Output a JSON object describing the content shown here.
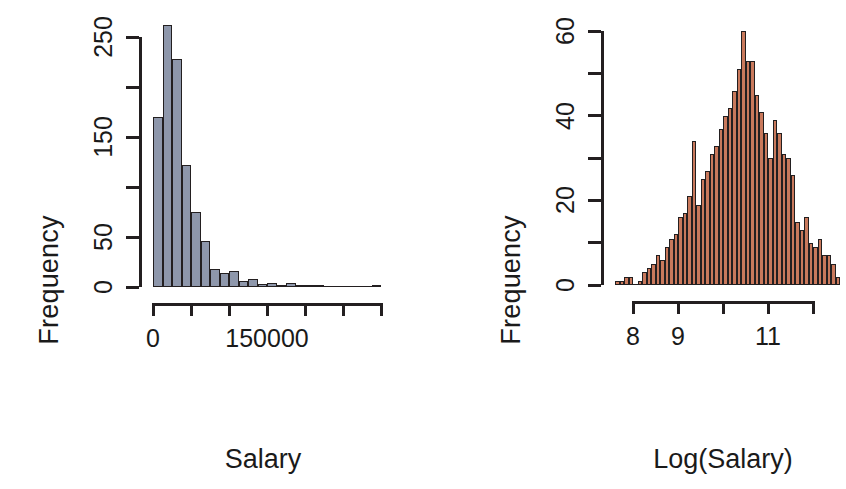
{
  "figure": {
    "background": "#ffffff",
    "axis_color": "#231f20"
  },
  "chart_data": [
    {
      "type": "bar",
      "id": "salary-histogram",
      "title": "",
      "xlabel": "Salary",
      "ylabel": "Frequency",
      "fill_color": "#8e97ab",
      "border_color": "#231f20",
      "xlim": [
        0,
        300000
      ],
      "ylim": [
        0,
        265
      ],
      "grid": false,
      "legend": null,
      "x_tick_labels": [
        "0",
        "",
        "",
        "150000",
        "",
        "",
        ""
      ],
      "x_ticks": [
        0,
        50000,
        100000,
        150000,
        200000,
        250000,
        300000
      ],
      "y_tick_labels": [
        "0",
        "50",
        "",
        "150",
        "",
        "250"
      ],
      "y_ticks": [
        0,
        50,
        100,
        150,
        200,
        250
      ],
      "bin_width": 12500,
      "bin_starts": [
        0,
        12500,
        25000,
        37500,
        50000,
        62500,
        75000,
        87500,
        100000,
        112500,
        125000,
        137500,
        150000,
        162500,
        175000,
        187500,
        200000,
        212500,
        225000,
        237500,
        250000,
        262500,
        275000,
        287500
      ],
      "values": [
        170,
        262,
        228,
        122,
        75,
        46,
        18,
        14,
        16,
        6,
        8,
        3,
        4,
        2,
        4,
        1,
        1,
        1,
        0,
        0,
        0,
        0,
        0,
        1
      ]
    },
    {
      "type": "bar",
      "id": "log-salary-histogram",
      "title": "",
      "xlabel": "Log(Salary)",
      "ylabel": "Frequency",
      "fill_color": "#c9795c",
      "border_color": "#231f20",
      "xlim": [
        7.6,
        12.6
      ],
      "ylim": [
        0,
        62
      ],
      "grid": false,
      "legend": null,
      "x_tick_labels": [
        "8",
        "9",
        "",
        "11",
        ""
      ],
      "x_ticks": [
        8,
        9,
        10,
        11,
        12
      ],
      "y_tick_labels": [
        "0",
        "",
        "20",
        "",
        "40",
        "",
        "60"
      ],
      "y_ticks": [
        0,
        10,
        20,
        30,
        40,
        50,
        60
      ],
      "bin_width": 0.1,
      "bin_starts": [
        7.6,
        7.7,
        7.8,
        7.9,
        8.0,
        8.1,
        8.2,
        8.3,
        8.4,
        8.5,
        8.6,
        8.7,
        8.8,
        8.9,
        9.0,
        9.1,
        9.2,
        9.3,
        9.4,
        9.5,
        9.6,
        9.7,
        9.8,
        9.9,
        10.0,
        10.1,
        10.2,
        10.3,
        10.4,
        10.5,
        10.6,
        10.7,
        10.8,
        10.9,
        11.0,
        11.1,
        11.2,
        11.3,
        11.4,
        11.5,
        11.6,
        11.7,
        11.8,
        11.9,
        12.0,
        12.1,
        12.2,
        12.3,
        12.4,
        12.5
      ],
      "values": [
        1,
        1,
        2,
        2,
        0,
        1,
        3,
        4,
        5,
        7,
        6,
        9,
        11,
        12,
        16,
        17,
        21,
        34,
        19,
        25,
        27,
        31,
        33,
        37,
        40,
        42,
        46,
        51,
        60,
        53,
        53,
        45,
        41,
        36,
        30,
        39,
        36,
        31,
        30,
        26,
        15,
        13,
        16,
        10,
        9,
        11,
        7,
        7,
        5,
        2
      ]
    }
  ]
}
